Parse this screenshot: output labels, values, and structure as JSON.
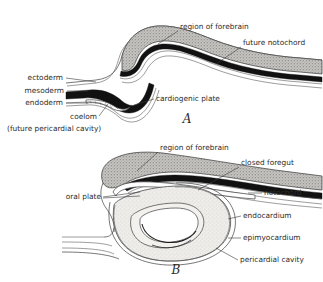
{
  "figure": {
    "background_color": "#ffffff",
    "ink_color": "#2b2b2b"
  },
  "panels": [
    {
      "letter": "A",
      "letter_x": 187,
      "letter_y": 123,
      "labels": [
        {
          "id": "region-of-forebrain-a",
          "text": "region of forebrain",
          "x": 180,
          "y": 29,
          "anchor": "start"
        },
        {
          "id": "future-notochord-a",
          "text": "future notochord",
          "x": 243,
          "y": 45,
          "anchor": "start"
        },
        {
          "id": "ectoderm-a",
          "text": "ectoderm",
          "x": 63,
          "y": 80,
          "anchor": "end"
        },
        {
          "id": "mesoderm-a",
          "text": "mesoderm",
          "x": 64,
          "y": 93,
          "anchor": "end"
        },
        {
          "id": "endoderm-a",
          "text": "endoderm",
          "x": 63,
          "y": 105,
          "anchor": "end"
        },
        {
          "id": "coelom-a",
          "text": "coelom",
          "x": 97,
          "y": 119,
          "anchor": "end"
        },
        {
          "id": "future-pericardial-cavity-a",
          "text": "(future pericardial cavity)",
          "x": 7,
          "y": 131,
          "anchor": "start"
        },
        {
          "id": "cardiogenic-plate-a",
          "text": "cardiogenic plate",
          "x": 156,
          "y": 101,
          "anchor": "start"
        }
      ]
    },
    {
      "letter": "B",
      "letter_x": 176,
      "letter_y": 274,
      "labels": [
        {
          "id": "region-of-forebrain-b",
          "text": "region of forebrain",
          "x": 160,
          "y": 150,
          "anchor": "start"
        },
        {
          "id": "closed-foregut-b",
          "text": "closed foregut",
          "x": 241,
          "y": 165,
          "anchor": "start"
        },
        {
          "id": "oral-plate-b",
          "text": "oral plate",
          "x": 101,
          "y": 199,
          "anchor": "end"
        },
        {
          "id": "notochord-b",
          "text": "notochord",
          "x": 264,
          "y": 195,
          "anchor": "start"
        },
        {
          "id": "endocardium-b",
          "text": "endocardium",
          "x": 243,
          "y": 218,
          "anchor": "start"
        },
        {
          "id": "epimyocardium-b",
          "text": "epimyocardium",
          "x": 243,
          "y": 240,
          "anchor": "start"
        },
        {
          "id": "pericardial-cavity-b",
          "text": "pericardial cavity",
          "x": 240,
          "y": 262,
          "anchor": "start"
        }
      ]
    }
  ],
  "structures": {
    "forebrain": "region of forebrain",
    "notochord": "notochord",
    "ectoderm": "ectoderm",
    "mesoderm": "mesoderm",
    "endoderm": "endoderm",
    "coelom": "coelom",
    "cardiogenic_plate": "cardiogenic plate",
    "foregut": "closed foregut",
    "oral_plate": "oral plate",
    "endocardium": "endocardium",
    "epimyocardium": "epimyocardium",
    "pericardial_cavity": "pericardial cavity"
  },
  "colors": {
    "ink": "#2b2b2b",
    "outline": "#4a4a4a",
    "black_band": "#111111",
    "stipple_gray": "#b8b6b2",
    "pale": "#f2f1ee",
    "background": "#ffffff"
  }
}
